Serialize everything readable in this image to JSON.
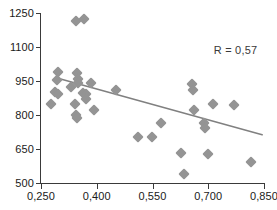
{
  "chart_data": {
    "type": "scatter",
    "title": "",
    "xlabel": "",
    "ylabel": "",
    "xlim": [
      0.25,
      0.85
    ],
    "ylim": [
      500,
      1250
    ],
    "xticks": [
      0.25,
      0.4,
      0.55,
      0.7,
      0.85
    ],
    "yticks": [
      500,
      650,
      800,
      950,
      1100,
      1250
    ],
    "xtick_labels": [
      "0,250",
      "0,400",
      "0,550",
      "0,700",
      "0,850"
    ],
    "ytick_labels": [
      "500",
      "650",
      "800",
      "950",
      "1100",
      "1250"
    ],
    "grid": false,
    "legend": null,
    "annotations": [
      {
        "text": "R = 0,57",
        "x": 0.715,
        "y": 1086
      }
    ],
    "marker_color": "#949494",
    "marker_shape": "diamond",
    "axis_color": "#3a3a3a",
    "trendline": {
      "type": "line",
      "color": "#808080",
      "x": [
        0.293,
        0.845
      ],
      "y": [
        963,
        713
      ]
    },
    "points": [
      {
        "x": 0.343,
        "y": 1214
      },
      {
        "x": 0.365,
        "y": 1222
      },
      {
        "x": 0.297,
        "y": 988
      },
      {
        "x": 0.293,
        "y": 954
      },
      {
        "x": 0.288,
        "y": 900
      },
      {
        "x": 0.295,
        "y": 893
      },
      {
        "x": 0.276,
        "y": 849
      },
      {
        "x": 0.33,
        "y": 925
      },
      {
        "x": 0.348,
        "y": 984
      },
      {
        "x": 0.349,
        "y": 960
      },
      {
        "x": 0.35,
        "y": 943
      },
      {
        "x": 0.385,
        "y": 941
      },
      {
        "x": 0.363,
        "y": 898
      },
      {
        "x": 0.37,
        "y": 893
      },
      {
        "x": 0.372,
        "y": 872
      },
      {
        "x": 0.341,
        "y": 848
      },
      {
        "x": 0.345,
        "y": 801
      },
      {
        "x": 0.346,
        "y": 786
      },
      {
        "x": 0.393,
        "y": 821
      },
      {
        "x": 0.452,
        "y": 910
      },
      {
        "x": 0.51,
        "y": 704
      },
      {
        "x": 0.549,
        "y": 703
      },
      {
        "x": 0.574,
        "y": 765
      },
      {
        "x": 0.626,
        "y": 632
      },
      {
        "x": 0.634,
        "y": 541
      },
      {
        "x": 0.657,
        "y": 938
      },
      {
        "x": 0.659,
        "y": 912
      },
      {
        "x": 0.663,
        "y": 821
      },
      {
        "x": 0.689,
        "y": 763
      },
      {
        "x": 0.691,
        "y": 743
      },
      {
        "x": 0.7,
        "y": 628
      },
      {
        "x": 0.714,
        "y": 850
      },
      {
        "x": 0.768,
        "y": 845
      },
      {
        "x": 0.815,
        "y": 592
      }
    ]
  }
}
